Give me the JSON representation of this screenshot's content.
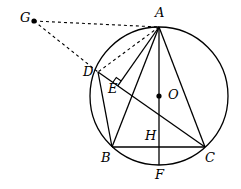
{
  "figure": {
    "stroke_color": "#000000",
    "background_color": "#ffffff",
    "dash_pattern": "3,3"
  },
  "circle": {
    "name": "circumscribed-circle",
    "center_label": "O",
    "cx": 159,
    "cy": 96,
    "r": 69
  },
  "points": [
    {
      "id": "A",
      "label": "A",
      "x": 159,
      "y": 27,
      "label_x": 155,
      "label_y": 6,
      "dot": false
    },
    {
      "id": "B",
      "label": "B",
      "x": 112,
      "y": 147,
      "label_x": 101,
      "label_y": 151,
      "dot": false
    },
    {
      "id": "C",
      "label": "C",
      "x": 205,
      "y": 147,
      "label_x": 205,
      "label_y": 151,
      "dot": false
    },
    {
      "id": "D",
      "label": "D",
      "x": 98,
      "y": 72,
      "label_x": 83,
      "label_y": 65,
      "dot": false
    },
    {
      "id": "E",
      "label": "E",
      "x": 124,
      "y": 81,
      "label_x": 108,
      "label_y": 82,
      "dot": false
    },
    {
      "id": "F",
      "label": "F",
      "x": 159,
      "y": 165,
      "label_x": 155,
      "label_y": 168,
      "dot": false
    },
    {
      "id": "G",
      "label": "G",
      "x": 34,
      "y": 21,
      "label_x": 20,
      "label_y": 11,
      "dot": true
    },
    {
      "id": "H",
      "label": "H",
      "x": 159,
      "y": 147,
      "label_x": 145,
      "label_y": 129,
      "dot": false
    },
    {
      "id": "O",
      "label": "O",
      "x": 159,
      "y": 96,
      "label_x": 168,
      "label_y": 88,
      "dot": true
    }
  ],
  "segments": [
    {
      "name": "segment-A-B",
      "from": "A",
      "to": "B",
      "style": "solid"
    },
    {
      "name": "segment-A-C",
      "from": "A",
      "to": "C",
      "style": "solid"
    },
    {
      "name": "segment-A-F",
      "from": "A",
      "to": "F",
      "style": "solid"
    },
    {
      "name": "segment-A-E",
      "from": "A",
      "to": "E",
      "style": "solid"
    },
    {
      "name": "segment-B-C",
      "from": "B",
      "to": "C",
      "style": "solid"
    },
    {
      "name": "segment-B-D",
      "from": "B",
      "to": "D",
      "style": "solid"
    },
    {
      "name": "segment-D-C",
      "from": "D",
      "to": "C",
      "style": "solid"
    },
    {
      "name": "segment-A-D",
      "from": "A",
      "to": "D",
      "style": "dashed"
    },
    {
      "name": "segment-G-A",
      "from": "G",
      "to": "A",
      "style": "dashed"
    },
    {
      "name": "segment-G-D",
      "from": "G",
      "to": "D",
      "style": "dashed"
    }
  ],
  "right_angle": {
    "name": "right-angle-mark-at-E",
    "at": "E",
    "x": 124,
    "y": 81,
    "size": 6
  },
  "labels": {
    "A": "A",
    "B": "B",
    "C": "C",
    "D": "D",
    "E": "E",
    "F": "F",
    "G": "G",
    "H": "H",
    "O": "O"
  }
}
